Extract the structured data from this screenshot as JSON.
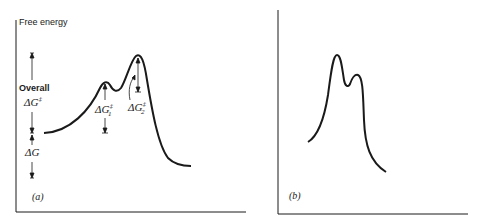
{
  "panel_a": {
    "axis_label": "Free energy",
    "overall_label": "Overall",
    "overall_symbol": "ΔG",
    "overall_sup": "‡",
    "dg_label": "ΔG",
    "dg1_symbol": "ΔG",
    "dg1_sup": "‡",
    "dg1_sub": "1",
    "dg2_symbol": "ΔG",
    "dg2_sup": "‡",
    "dg2_sub": "2",
    "panel_label": "(a)"
  },
  "panel_b": {
    "panel_label": "(b)"
  },
  "colors": {
    "ink": "#1a1a1a",
    "background": "#ffffff"
  }
}
